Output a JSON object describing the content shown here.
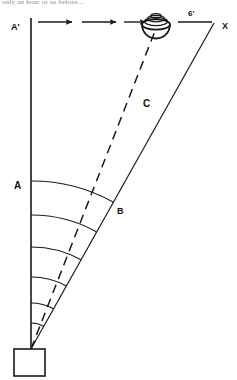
{
  "figure": {
    "title_fragment": "only an hour or so before...",
    "background_color": "#ffffff",
    "stroke_color": "#1a1a1a",
    "labels": {
      "a_prime": "A'",
      "a": "A",
      "b": "B",
      "c": "C",
      "x": "X",
      "distance": "6'"
    },
    "icons": {
      "saucer": "flying-saucer-icon",
      "observer": "observer-box-icon",
      "motion_arrow": "right-arrow-icon"
    },
    "geometry": {
      "apex": {
        "x": 31,
        "y": 349
      },
      "vertical_line": {
        "x1": 31,
        "y1": 18,
        "x2": 31,
        "y2": 349
      },
      "solid_diagonal": {
        "x1": 31,
        "y1": 349,
        "x2": 214,
        "y2": 23
      },
      "dashed_line": {
        "x1": 31,
        "y1": 349,
        "x2": 155,
        "y2": 30
      },
      "saucer_center": {
        "x": 156,
        "y": 20
      },
      "observer_square": {
        "x": 14,
        "y": 349,
        "width": 31,
        "height": 27
      },
      "measure_line": {
        "x1": 178,
        "y1": 22,
        "x2": 212,
        "y2": 22
      },
      "arrows_y": 22,
      "arrows": [
        {
          "x1": 38,
          "x2": 74
        },
        {
          "x1": 82,
          "x2": 118
        },
        {
          "x1": 124,
          "x2": 148
        }
      ],
      "arc_radii": [
        168,
        134,
        102,
        72,
        46,
        26
      ],
      "arc_start_angle_deg": -90,
      "arc_end_angle_deg": -60.7
    }
  }
}
